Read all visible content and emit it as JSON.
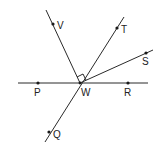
{
  "diagram": {
    "type": "geometry-angles",
    "vertex": {
      "label": "W",
      "x": 80,
      "y": 83
    },
    "points": [
      {
        "label": "P",
        "x": 38,
        "y": 83
      },
      {
        "label": "R",
        "x": 128,
        "y": 83
      },
      {
        "label": "V",
        "x": 53,
        "y": 24
      },
      {
        "label": "T",
        "x": 117,
        "y": 28
      },
      {
        "label": "S",
        "x": 146,
        "y": 53
      },
      {
        "label": "Q",
        "x": 49,
        "y": 132
      }
    ],
    "lines": [
      {
        "name": "line-PR",
        "through": [
          "P",
          "W",
          "R"
        ]
      },
      {
        "name": "line-TQ",
        "through": [
          "T",
          "W",
          "Q"
        ]
      },
      {
        "name": "ray-WV",
        "through": [
          "W",
          "V"
        ]
      },
      {
        "name": "ray-WS",
        "through": [
          "W",
          "S"
        ]
      }
    ],
    "right_angle": {
      "between": [
        "WV",
        "WT"
      ],
      "at": "W"
    }
  },
  "labels": {
    "V": "V",
    "T": "T",
    "S": "S",
    "P": "P",
    "W": "W",
    "R": "R",
    "Q": "Q"
  }
}
